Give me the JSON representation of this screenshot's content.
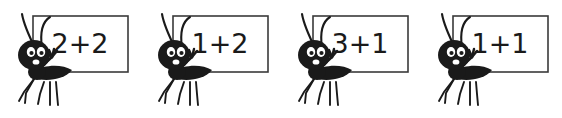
{
  "worksheet": {
    "title": "Ant addition flashcards",
    "background_color": "#ffffff",
    "ink_color": "#1a1a1a",
    "sign_fill_color": "#ffffff",
    "sign_border_color": "#3a3a3a",
    "ant_body_color": "#1a1a1a",
    "ant_eye_color": "#ffffff",
    "card_count": 4
  },
  "cards": [
    {
      "index": 1,
      "problem": "2+2",
      "first_addend": "2",
      "operator": "+",
      "second_addend": "2",
      "ant_label": "ant-holding-sign",
      "sign_label": "math-problem-sign"
    },
    {
      "index": 2,
      "problem": "1+2",
      "first_addend": "1",
      "operator": "+",
      "second_addend": "2",
      "ant_label": "ant-holding-sign",
      "sign_label": "math-problem-sign"
    },
    {
      "index": 3,
      "problem": "3+1",
      "first_addend": "3",
      "operator": "+",
      "second_addend": "1",
      "ant_label": "ant-holding-sign",
      "sign_label": "math-problem-sign"
    },
    {
      "index": 4,
      "problem": "1+1",
      "first_addend": "1",
      "operator": "+",
      "second_addend": "1",
      "ant_label": "ant-holding-sign",
      "sign_label": "math-problem-sign"
    }
  ]
}
